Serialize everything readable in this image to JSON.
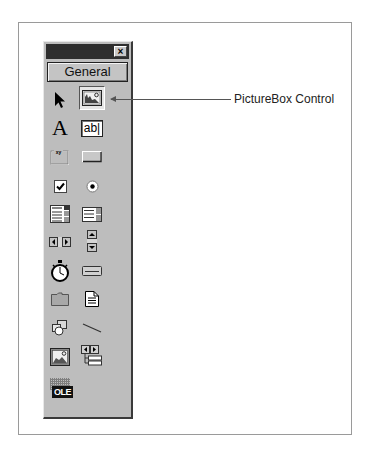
{
  "toolbox": {
    "title": "",
    "close_label": "×",
    "tab_label": "General",
    "tools": [
      {
        "name": "Pointer",
        "icon": "pointer-icon"
      },
      {
        "name": "PictureBox",
        "icon": "picturebox-icon",
        "selected": true
      },
      {
        "name": "Label",
        "icon": "label-icon",
        "glyph": "A"
      },
      {
        "name": "TextBox",
        "icon": "textbox-icon",
        "glyph": "ab|"
      },
      {
        "name": "Frame",
        "icon": "frame-icon",
        "glyph": "xy"
      },
      {
        "name": "CommandButton",
        "icon": "command-button-icon"
      },
      {
        "name": "CheckBox",
        "icon": "checkbox-icon"
      },
      {
        "name": "OptionButton",
        "icon": "option-button-icon"
      },
      {
        "name": "ComboBox",
        "icon": "combobox-icon"
      },
      {
        "name": "ListBox",
        "icon": "listbox-icon"
      },
      {
        "name": "HScrollBar",
        "icon": "hscrollbar-icon"
      },
      {
        "name": "VScrollBar",
        "icon": "vscrollbar-icon"
      },
      {
        "name": "Timer",
        "icon": "timer-icon"
      },
      {
        "name": "DriveListBox",
        "icon": "drive-listbox-icon"
      },
      {
        "name": "DirListBox",
        "icon": "dir-listbox-icon"
      },
      {
        "name": "FileListBox",
        "icon": "file-listbox-icon"
      },
      {
        "name": "Shape",
        "icon": "shape-icon"
      },
      {
        "name": "Line",
        "icon": "line-icon"
      },
      {
        "name": "Image",
        "icon": "image-icon"
      },
      {
        "name": "Data",
        "icon": "data-icon"
      },
      {
        "name": "OLE",
        "icon": "ole-icon",
        "glyph": "OLE"
      }
    ]
  },
  "callout": {
    "label": "PictureBox Control"
  }
}
